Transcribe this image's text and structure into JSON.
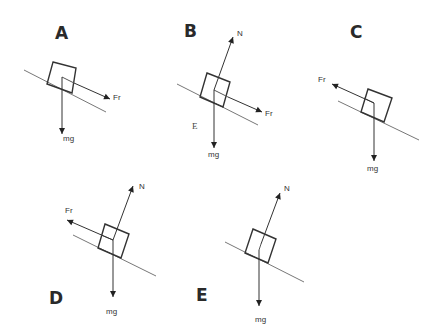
{
  "figure": {
    "panels": [
      {
        "id": "A",
        "letter": {
          "text": "A",
          "x": 55,
          "y": 39
        },
        "incline": [
          [
            24,
            70
          ],
          [
            106,
            112
          ]
        ],
        "block": [
          [
            53,
            62
          ],
          [
            76,
            68
          ],
          [
            72,
            93
          ],
          [
            47,
            84
          ]
        ],
        "inner_lines": [
          [
            [
              62,
              77
            ],
            [
              74,
              83
            ]
          ]
        ],
        "forces": [
          {
            "name": "friction",
            "label": "Fr",
            "from": [
              74,
              83
            ],
            "to": [
              110,
              99
            ],
            "label_pos": [
              113,
              100
            ]
          },
          {
            "name": "weight",
            "label": "mg",
            "from": [
              62,
              77
            ],
            "to": [
              62,
              134
            ],
            "label_pos": [
              63,
              141
            ]
          }
        ]
      },
      {
        "id": "B",
        "letter": {
          "text": "B",
          "x": 184,
          "y": 37
        },
        "incline": [
          [
            177,
            84
          ],
          [
            258,
            125
          ]
        ],
        "block": [
          [
            207,
            73
          ],
          [
            230,
            82
          ],
          [
            223,
            107
          ],
          [
            200,
            97
          ]
        ],
        "inner_lines": [
          [
            [
              214,
              90
            ],
            [
              228,
              97
            ]
          ]
        ],
        "forces": [
          {
            "name": "normal",
            "label": "N",
            "from": [
              214,
              90
            ],
            "to": [
              233,
              37
            ],
            "label_pos": [
              237,
              36
            ]
          },
          {
            "name": "friction",
            "label": "Fr",
            "from": [
              228,
              97
            ],
            "to": [
              262,
              112
            ],
            "label_pos": [
              265,
              116
            ]
          },
          {
            "name": "weight",
            "label": "mg",
            "from": [
              214,
              90
            ],
            "to": [
              214,
              148
            ],
            "label_pos": [
              208,
              157
            ]
          }
        ],
        "stray_text": {
          "text": "E",
          "x": 192,
          "y": 129
        }
      },
      {
        "id": "C",
        "letter": {
          "text": "C",
          "x": 350,
          "y": 38
        },
        "incline": [
          [
            338,
            101
          ],
          [
            419,
            140
          ]
        ],
        "block": [
          [
            368,
            89
          ],
          [
            392,
            98
          ],
          [
            384,
            122
          ],
          [
            361,
            112
          ]
        ],
        "inner_lines": [
          [
            [
              374,
              103
            ],
            [
              364,
              98
            ]
          ]
        ],
        "forces": [
          {
            "name": "friction",
            "label": "Fr",
            "from": [
              374,
              103
            ],
            "to": [
              332,
              84
            ],
            "label_pos": [
              318,
              82
            ]
          },
          {
            "name": "weight",
            "label": "mg",
            "from": [
              374,
              103
            ],
            "to": [
              374,
              161
            ],
            "label_pos": [
              367,
              171
            ]
          }
        ]
      },
      {
        "id": "D",
        "letter": {
          "text": "D",
          "x": 49,
          "y": 304
        },
        "incline": [
          [
            73,
            235
          ],
          [
            156,
            276
          ]
        ],
        "block": [
          [
            105,
            224
          ],
          [
            129,
            234
          ],
          [
            121,
            258
          ],
          [
            98,
            248
          ]
        ],
        "inner_lines": [
          [
            [
              113,
              240
            ],
            [
              101,
              235
            ]
          ]
        ],
        "forces": [
          {
            "name": "normal",
            "label": "N",
            "from": [
              113,
              240
            ],
            "to": [
              133,
              186
            ],
            "label_pos": [
              139,
              189
            ]
          },
          {
            "name": "friction",
            "label": "Fr",
            "from": [
              113,
              240
            ],
            "to": [
              67,
              220
            ],
            "label_pos": [
              65,
              213
            ]
          },
          {
            "name": "weight",
            "label": "mg",
            "from": [
              113,
              240
            ],
            "to": [
              113,
              297
            ],
            "label_pos": [
              106,
              314
            ]
          }
        ]
      },
      {
        "id": "E",
        "letter": {
          "text": "E",
          "x": 196,
          "y": 301
        },
        "incline": [
          [
            225,
            242
          ],
          [
            304,
            282
          ]
        ],
        "block": [
          [
            253,
            229
          ],
          [
            276,
            239
          ],
          [
            268,
            263
          ],
          [
            245,
            253
          ]
        ],
        "inner_lines": [
          [
            [
              261,
              244
            ],
            [
              259,
              250
            ]
          ]
        ],
        "forces": [
          {
            "name": "normal",
            "label": "N",
            "from": [
              261,
              244
            ],
            "to": [
              280,
              193
            ],
            "label_pos": [
              284,
              191
            ]
          },
          {
            "name": "weight",
            "label": "mg",
            "from": [
              259,
              250
            ],
            "to": [
              259,
              306
            ],
            "label_pos": [
              255,
              322
            ]
          }
        ]
      }
    ]
  }
}
